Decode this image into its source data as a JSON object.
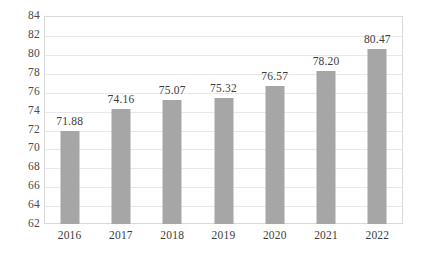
{
  "chart_data": {
    "type": "bar",
    "title": "",
    "xlabel": "",
    "ylabel": "",
    "categories": [
      "2016",
      "2017",
      "2018",
      "2019",
      "2020",
      "2021",
      "2022"
    ],
    "values": [
      71.88,
      74.16,
      75.07,
      75.32,
      76.57,
      78.2,
      80.47
    ],
    "data_labels": [
      "71.88",
      "74.16",
      "75.07",
      "75.32",
      "76.57",
      "78.20",
      "80.47"
    ],
    "ylim": [
      62,
      84
    ],
    "ytick_step": 2,
    "ytick_labels": [
      "84",
      "82",
      "80",
      "78",
      "76",
      "74",
      "72",
      "70",
      "68",
      "66",
      "64",
      "62"
    ],
    "ytick_values": [
      84,
      82,
      80,
      78,
      76,
      74,
      72,
      70,
      68,
      66,
      64,
      62
    ],
    "grid": true,
    "grid_axis": "y",
    "legend": false,
    "legend_position": "none",
    "series": [
      {
        "name": "",
        "values": [
          71.88,
          74.16,
          75.07,
          75.32,
          76.57,
          78.2,
          80.47
        ]
      }
    ],
    "colors": {
      "bar": "#a6a6a6",
      "gridline": "#e8e8e8",
      "plot_border": "#d9d9d9",
      "tick_text": "#4a4a4a",
      "label_text": "#3d3d3d",
      "background": "#ffffff"
    }
  }
}
